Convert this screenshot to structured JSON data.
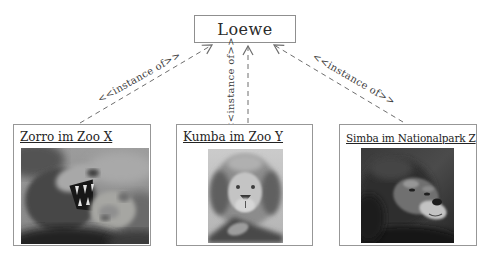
{
  "diagram": {
    "class_box": {
      "label": "Loewe"
    },
    "edge_label": "<<instance of>>",
    "instances": [
      {
        "title": "Zorro im Zoo X",
        "photo_name": "two-lions-one-roaring-photo"
      },
      {
        "title": "Kumba im Zoo Y",
        "photo_name": "lion-frontal-portrait-photo"
      },
      {
        "title": "Simba im Nationalpark Z",
        "photo_name": "dark-lion-head-photo"
      }
    ],
    "colors": {
      "background": "#ffffff",
      "box_border": "#979797",
      "arrow_line": "#6e6e6e",
      "text": "#2b2b2b"
    }
  }
}
